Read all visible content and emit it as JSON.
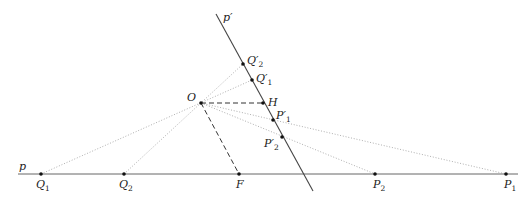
{
  "diagram": {
    "type": "projective-geometry-construction",
    "colors": {
      "line": "#555555",
      "dotted": "#9a9a9a",
      "dashed": "#333333",
      "point": "#111111",
      "text": "#222222"
    },
    "lines": {
      "p": {
        "label": "p",
        "from": [
          18,
          174
        ],
        "to": [
          518,
          174
        ]
      },
      "p_prime": {
        "label": "p′",
        "from": [
          216,
          14
        ],
        "to": [
          313,
          191
        ]
      }
    },
    "points": {
      "O": {
        "label": "O",
        "x": 201,
        "y": 103
      },
      "H": {
        "label": "H",
        "x": 263,
        "y": 103
      },
      "F": {
        "label": "F",
        "x": 239,
        "y": 174
      },
      "Q1": {
        "label": "Q",
        "sub": "1",
        "x": 41,
        "y": 174
      },
      "Q2": {
        "label": "Q",
        "sub": "2",
        "x": 124,
        "y": 174
      },
      "P2": {
        "label": "P",
        "sub": "2",
        "x": 375,
        "y": 174
      },
      "P1": {
        "label": "P",
        "sub": "1",
        "x": 506,
        "y": 174
      },
      "Q2p": {
        "label": "Q′",
        "sub": "2",
        "x": 243,
        "y": 64
      },
      "Q1p": {
        "label": "Q′",
        "sub": "1",
        "x": 252,
        "y": 80
      },
      "P1p": {
        "label": "P′",
        "sub": "1",
        "x": 273,
        "y": 120
      },
      "P2p": {
        "label": "P′",
        "sub": "2",
        "x": 282,
        "y": 137
      }
    },
    "dotted_segments": [
      [
        "Q1",
        "Q1p"
      ],
      [
        "Q2",
        "Q2p"
      ],
      [
        "O",
        "P1"
      ],
      [
        "O",
        "P2"
      ]
    ],
    "dashed_segments": [
      [
        "O",
        "H"
      ],
      [
        "O",
        "F"
      ]
    ]
  }
}
